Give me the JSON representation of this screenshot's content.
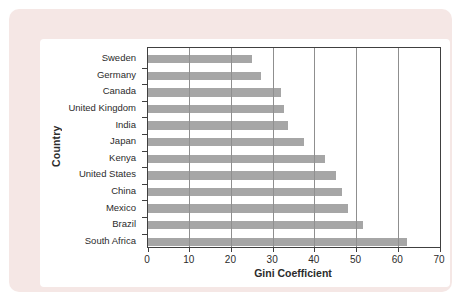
{
  "chart_data": {
    "type": "bar",
    "orientation": "horizontal",
    "title": "",
    "xlabel": "Gini Coefficient",
    "ylabel": "Country",
    "categories": [
      "Sweden",
      "Germany",
      "Canada",
      "United Kingdom",
      "India",
      "Japan",
      "Kenya",
      "United States",
      "China",
      "Mexico",
      "Brazil",
      "South Africa"
    ],
    "values": [
      25,
      27,
      32,
      32.5,
      33.5,
      37.5,
      42.5,
      45,
      46.5,
      48,
      51.5,
      62
    ],
    "xlim": [
      0,
      70
    ],
    "xticks": [
      0,
      10,
      20,
      30,
      40,
      50,
      60,
      70
    ],
    "grid": "vertical gridlines every 10 units, drawn over bars",
    "legend": "none"
  },
  "colors": {
    "bar": "#a6a6a6",
    "gridline": "#8f8f8f",
    "axis": "#404040",
    "text": "#2b2b2b",
    "frame_background": "#f5e7e5",
    "plot_background": "#ffffff"
  }
}
